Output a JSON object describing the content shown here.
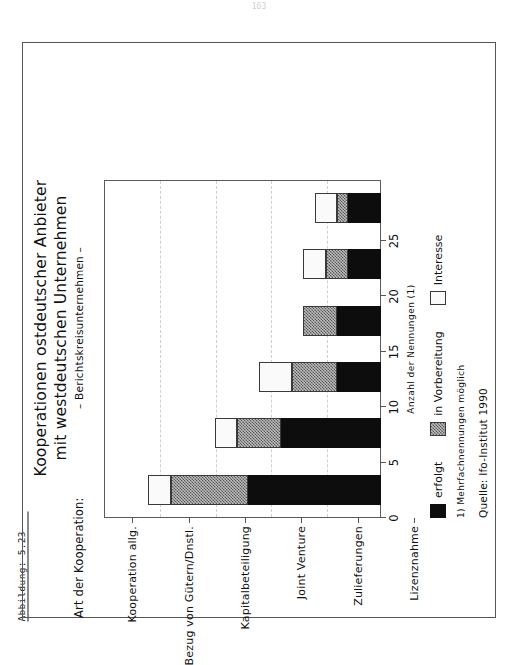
{
  "page": {
    "page_number": "163"
  },
  "figure": {
    "caption": "Abbildung: 5.23"
  },
  "chart_data": {
    "type": "bar",
    "orientation": "vertical",
    "stacked": true,
    "title": "Kooperationen ostdeutscher Anbieter",
    "title_line2": "mit westdeutschen Unternehmen",
    "subtitle": "– Berichtskreisunternehmen –",
    "xlabel": "Art der Kooperation:",
    "ylabel": "Anzahl der Nennungen (1)",
    "ylim": [
      0,
      25
    ],
    "yticks": [
      0,
      5,
      10,
      15,
      20,
      25
    ],
    "ytick_labels": [
      "0",
      "5",
      "10",
      "15",
      "20",
      "25"
    ],
    "grid": true,
    "legend_position": "below",
    "categories": [
      "Kooperation allg.",
      "Bezug von Gütern/Dnstl.",
      "Kapitalbeteiligung",
      "Joint Venture",
      "Zulieferungen",
      "Lizenznahme"
    ],
    "series": [
      {
        "name": "erfolgt",
        "color": "#0d0d0d",
        "fill": "solid-black",
        "values": [
          12,
          9,
          4,
          4,
          3,
          3
        ]
      },
      {
        "name": "in Vorbereitung",
        "color": "#8a8a8a",
        "fill": "hatched-gray",
        "values": [
          7,
          4,
          4,
          3,
          2,
          1
        ]
      },
      {
        "name": "Interesse",
        "color": "#fafafa",
        "fill": "white",
        "values": [
          2,
          2,
          3,
          0,
          2,
          2
        ]
      }
    ],
    "totals": [
      21,
      15,
      11,
      7,
      7,
      6
    ],
    "annotations": [
      "1) Mehrfachnennungen möglich",
      "Quelle: Ifo-Institut 1990"
    ]
  },
  "footnotes": {
    "note_1": "1) Mehrfachnennungen möglich",
    "source": "Quelle: Ifo-Institut 1990"
  }
}
